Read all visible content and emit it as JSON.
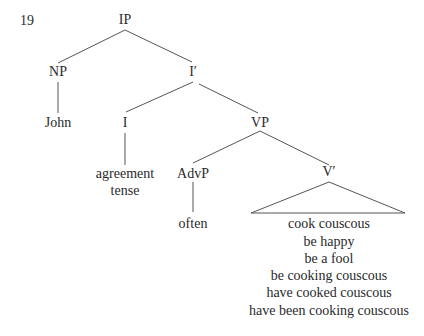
{
  "example_number": "19",
  "nodes": {
    "ip": "IP",
    "np": "NP",
    "john": "John",
    "i_bar": "I′",
    "i": "I",
    "i_features": [
      "agreement",
      "tense"
    ],
    "vp": "VP",
    "advp": "AdvP",
    "often": "often",
    "v_bar": "V′",
    "v_bar_contents": [
      "cook couscous",
      "be happy",
      "be a fool",
      "be cooking couscous",
      "have cooked couscous",
      "have been cooking couscous"
    ]
  }
}
